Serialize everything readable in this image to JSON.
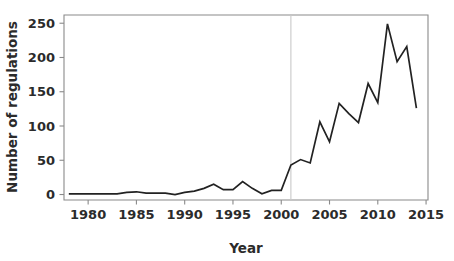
{
  "chart_data": {
    "type": "line",
    "title": "",
    "xlabel": "Year",
    "ylabel": "Number of regulations",
    "xlim": [
      1977.5,
      2015.2
    ],
    "ylim": [
      -8,
      262
    ],
    "grid": false,
    "legend": null,
    "x_ticks": [
      1980,
      1985,
      1990,
      1995,
      2000,
      2005,
      2010,
      2015
    ],
    "x_tick_labels": [
      "1980",
      "1985",
      "1990",
      "1995",
      "2000",
      "2005",
      "2010",
      "2015"
    ],
    "y_ticks": [
      0,
      50,
      100,
      150,
      200,
      250
    ],
    "y_tick_labels": [
      "0",
      "50",
      "100",
      "150",
      "200",
      "250"
    ],
    "line_color": "#222222",
    "annotations": [
      {
        "name": "year-2001-reference-line",
        "type": "vertical-line",
        "x": 2001,
        "color": "#c9c9c9"
      }
    ],
    "series": [
      {
        "name": "Number of regulations",
        "color": "#222222",
        "x": [
          1978,
          1979,
          1980,
          1981,
          1982,
          1983,
          1984,
          1985,
          1986,
          1987,
          1988,
          1989,
          1990,
          1991,
          1992,
          1993,
          1994,
          1995,
          1996,
          1997,
          1998,
          1999,
          2000,
          2001,
          2002,
          2003,
          2004,
          2005,
          2006,
          2007,
          2008,
          2009,
          2010,
          2011,
          2012,
          2013,
          2014
        ],
        "values": [
          1,
          1,
          1,
          1,
          1,
          1,
          3,
          4,
          2,
          2,
          2,
          0,
          3,
          5,
          9,
          15,
          7,
          7,
          19,
          9,
          1,
          6,
          6,
          43,
          51,
          46,
          106,
          77,
          133,
          118,
          105,
          162,
          134,
          249,
          194,
          216,
          126
        ]
      }
    ]
  },
  "axis_labels": {
    "x_title": "Year",
    "y_title": "Number of regulations"
  }
}
